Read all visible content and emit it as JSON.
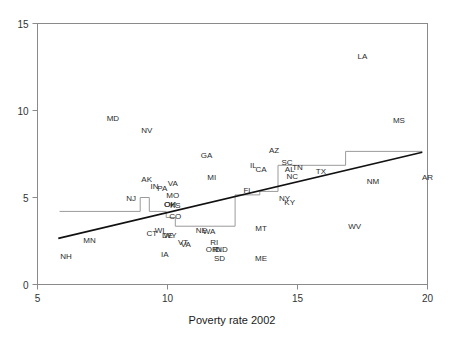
{
  "chart_data": {
    "type": "scatter",
    "title": "",
    "subtitle": "",
    "xlabel": "Poverty rate 2002",
    "ylabel": "",
    "xlim": [
      5,
      20
    ],
    "ylim": [
      0,
      15
    ],
    "xticks": [
      5,
      10,
      15,
      20
    ],
    "yticks": [
      0,
      5,
      10,
      15
    ],
    "xtick_labels": [
      "5",
      "10",
      "15",
      "20"
    ],
    "ytick_labels": [
      "0",
      "5",
      "10",
      "15"
    ],
    "grid": false,
    "legend": null,
    "point_label_mode": "text-abbreviation",
    "points": [
      {
        "label": "NH",
        "x": 6.1,
        "y": 1.6
      },
      {
        "label": "MN",
        "x": 7.0,
        "y": 2.5
      },
      {
        "label": "MD",
        "x": 7.9,
        "y": 9.5
      },
      {
        "label": "NJ",
        "x": 8.6,
        "y": 4.9
      },
      {
        "label": "NV",
        "x": 9.2,
        "y": 8.8
      },
      {
        "label": "AK",
        "x": 9.2,
        "y": 6.0
      },
      {
        "label": "IN",
        "x": 9.5,
        "y": 5.6
      },
      {
        "label": "CT",
        "x": 9.4,
        "y": 2.9
      },
      {
        "label": "WI",
        "x": 9.7,
        "y": 3.1
      },
      {
        "label": "PA",
        "x": 9.8,
        "y": 5.5
      },
      {
        "label": "VA",
        "x": 10.2,
        "y": 5.8
      },
      {
        "label": "MO",
        "x": 10.2,
        "y": 5.1
      },
      {
        "label": "DE",
        "x": 10.0,
        "y": 2.8
      },
      {
        "label": "WY",
        "x": 10.1,
        "y": 2.8
      },
      {
        "label": "OH",
        "x": 10.1,
        "y": 4.6
      },
      {
        "label": "KS",
        "x": 10.3,
        "y": 4.5
      },
      {
        "label": "OK",
        "x": 10.1,
        "y": 4.6
      },
      {
        "label": "CO",
        "x": 10.3,
        "y": 3.9
      },
      {
        "label": "IA",
        "x": 9.9,
        "y": 1.7
      },
      {
        "label": "VT",
        "x": 10.6,
        "y": 2.4
      },
      {
        "label": "VA2",
        "x": 10.7,
        "y": 2.3
      },
      {
        "label": "GA",
        "x": 11.5,
        "y": 7.4
      },
      {
        "label": "MI",
        "x": 11.7,
        "y": 6.1
      },
      {
        "label": "NE",
        "x": 11.3,
        "y": 3.1
      },
      {
        "label": "WA",
        "x": 11.6,
        "y": 3.0
      },
      {
        "label": "RI",
        "x": 11.8,
        "y": 2.4
      },
      {
        "label": "OR",
        "x": 11.7,
        "y": 2.0
      },
      {
        "label": "ID",
        "x": 11.9,
        "y": 2.0
      },
      {
        "label": "ND",
        "x": 12.1,
        "y": 2.0
      },
      {
        "label": "SD",
        "x": 12.0,
        "y": 1.5
      },
      {
        "label": "IL",
        "x": 13.3,
        "y": 6.8
      },
      {
        "label": "CA",
        "x": 13.6,
        "y": 6.6
      },
      {
        "label": "FL",
        "x": 13.1,
        "y": 5.4
      },
      {
        "label": "AZ",
        "x": 14.1,
        "y": 7.7
      },
      {
        "label": "MT",
        "x": 13.6,
        "y": 3.2
      },
      {
        "label": "ME",
        "x": 13.6,
        "y": 1.5
      },
      {
        "label": "SC",
        "x": 14.6,
        "y": 7.0
      },
      {
        "label": "AL",
        "x": 14.7,
        "y": 6.6
      },
      {
        "label": "TN",
        "x": 15.0,
        "y": 6.7
      },
      {
        "label": "NC",
        "x": 14.8,
        "y": 6.2
      },
      {
        "label": "NY",
        "x": 14.5,
        "y": 4.9
      },
      {
        "label": "KY",
        "x": 14.7,
        "y": 4.7
      },
      {
        "label": "TX",
        "x": 15.9,
        "y": 6.5
      },
      {
        "label": "WV",
        "x": 17.2,
        "y": 3.3
      },
      {
        "label": "LA",
        "x": 17.5,
        "y": 13.1
      },
      {
        "label": "NM",
        "x": 17.9,
        "y": 5.9
      },
      {
        "label": "MS",
        "x": 18.9,
        "y": 9.4
      },
      {
        "label": "AR",
        "x": 20.0,
        "y": 6.1
      }
    ],
    "fit_line": {
      "name": "regression-line",
      "x0": 5.8,
      "y0": 2.65,
      "x1": 19.8,
      "y1": 7.6,
      "color": "#111111"
    },
    "step_line": {
      "name": "step-function",
      "color": "#9a9a9a",
      "vertices": [
        [
          5.85,
          4.2
        ],
        [
          8.95,
          4.2
        ],
        [
          8.95,
          5.0
        ],
        [
          9.3,
          5.0
        ],
        [
          9.3,
          4.2
        ],
        [
          9.95,
          4.2
        ],
        [
          9.95,
          3.85
        ],
        [
          10.3,
          3.85
        ],
        [
          10.3,
          3.35
        ],
        [
          12.6,
          3.35
        ],
        [
          12.6,
          5.15
        ],
        [
          13.55,
          5.15
        ],
        [
          13.55,
          5.35
        ],
        [
          14.25,
          5.35
        ],
        [
          14.25,
          6.85
        ],
        [
          16.85,
          6.85
        ],
        [
          16.85,
          7.65
        ],
        [
          19.8,
          7.65
        ]
      ]
    }
  },
  "axes": {
    "x_axis_name": "poverty-rate-axis",
    "y_axis_name": "value-axis"
  }
}
